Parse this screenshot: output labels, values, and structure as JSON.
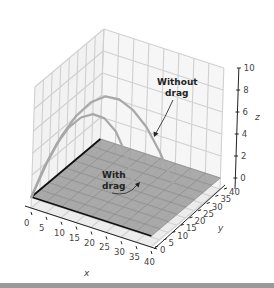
{
  "chart_data": {
    "type": "line",
    "projection": "3d",
    "title": "",
    "xlabel": "x",
    "ylabel": "y",
    "zlabel": "z",
    "xlim": [
      0,
      40
    ],
    "ylim": [
      0,
      40
    ],
    "zlim": [
      -1,
      10
    ],
    "xticks": [
      "0",
      "5",
      "10",
      "15",
      "20",
      "25",
      "30",
      "35",
      "40"
    ],
    "yticks": [
      "0",
      "5",
      "10",
      "15",
      "20",
      "25",
      "30",
      "35",
      "40"
    ],
    "zticks": [
      "0",
      "2",
      "4",
      "6",
      "8",
      "10"
    ],
    "grid": true,
    "floor_plane": {
      "z": 0,
      "x": [
        0,
        40
      ],
      "y": [
        0,
        40
      ],
      "color": "#9e9e9e"
    },
    "series": [
      {
        "name": "Without drag",
        "color": "#a8a8a8",
        "points": [
          {
            "x": 0,
            "y": 0,
            "z": 0
          },
          {
            "x": 3,
            "y": 3,
            "z": 2.9
          },
          {
            "x": 6,
            "y": 6,
            "z": 5.3
          },
          {
            "x": 9,
            "y": 9,
            "z": 7.0
          },
          {
            "x": 12,
            "y": 12,
            "z": 8.1
          },
          {
            "x": 15,
            "y": 15,
            "z": 8.5
          },
          {
            "x": 18,
            "y": 18,
            "z": 8.1
          },
          {
            "x": 21,
            "y": 21,
            "z": 7.0
          },
          {
            "x": 24,
            "y": 24,
            "z": 5.3
          },
          {
            "x": 27,
            "y": 27,
            "z": 2.9
          },
          {
            "x": 30,
            "y": 30,
            "z": 0
          }
        ]
      },
      {
        "name": "With drag",
        "color": "#a8a8a8",
        "points": [
          {
            "x": 0,
            "y": 0,
            "z": 0
          },
          {
            "x": 2.5,
            "y": 2.5,
            "z": 2.6
          },
          {
            "x": 5,
            "y": 5,
            "z": 4.6
          },
          {
            "x": 7.5,
            "y": 7.5,
            "z": 6.0
          },
          {
            "x": 10,
            "y": 10,
            "z": 6.8
          },
          {
            "x": 12.5,
            "y": 12.5,
            "z": 7.0
          },
          {
            "x": 15,
            "y": 15,
            "z": 6.5
          },
          {
            "x": 17.5,
            "y": 17.5,
            "z": 5.2
          },
          {
            "x": 19.5,
            "y": 19.5,
            "z": 3.3
          },
          {
            "x": 21,
            "y": 21,
            "z": 1.2
          },
          {
            "x": 21.8,
            "y": 21.8,
            "z": 0
          }
        ]
      }
    ],
    "annotations": [
      {
        "text_lines": [
          "Without",
          "drag"
        ],
        "target_series": "Without drag"
      },
      {
        "text_lines": [
          "With",
          "drag"
        ],
        "target_series": "With drag"
      }
    ]
  }
}
